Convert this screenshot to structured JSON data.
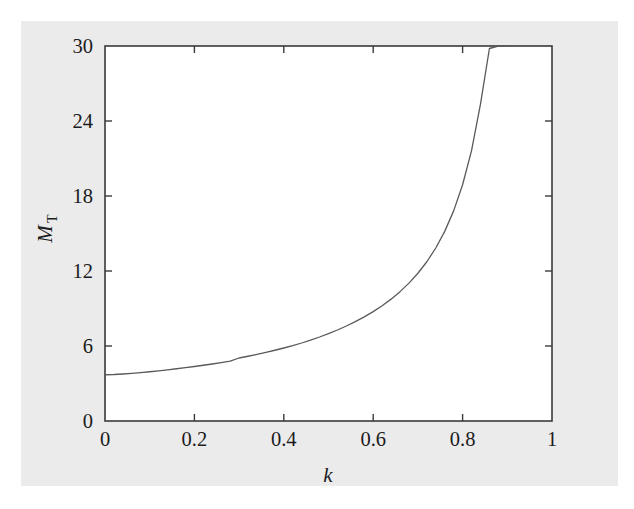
{
  "figure": {
    "background_color": "#ebebeb",
    "plot_background_color": "#ffffff",
    "frame_color": "#3a3a3a",
    "curve_color": "#5a5a5a"
  },
  "chart_data": {
    "type": "line",
    "title": "",
    "subtitle": "",
    "xlabel": "k",
    "ylabel": "M_T",
    "ylabel_base": "M",
    "ylabel_subscript": "T",
    "xlim": [
      0,
      1
    ],
    "ylim": [
      0,
      30
    ],
    "xticks": [
      0,
      0.2,
      0.4,
      0.6,
      0.8,
      1
    ],
    "xtick_labels": [
      "0",
      "0.2",
      "0.4",
      "0.6",
      "0.8",
      "1"
    ],
    "yticks": [
      0,
      6,
      12,
      18,
      24,
      30
    ],
    "ytick_labels": [
      "0",
      "6",
      "12",
      "18",
      "24",
      "30"
    ],
    "grid": false,
    "legend": null,
    "legend_position": "none",
    "annotations": [],
    "series": [
      {
        "name": "M_T(k)",
        "note": "monotonically increasing, diverges as k approaches 1; leaves top of frame at k ~= 0.906",
        "x": [
          0.0,
          0.02,
          0.04,
          0.06,
          0.08,
          0.1,
          0.12,
          0.14,
          0.16,
          0.18,
          0.2,
          0.22,
          0.24,
          0.26,
          0.28,
          0.3,
          0.32,
          0.34,
          0.36,
          0.38,
          0.4,
          0.42,
          0.44,
          0.46,
          0.48,
          0.5,
          0.52,
          0.54,
          0.56,
          0.58,
          0.6,
          0.62,
          0.64,
          0.66,
          0.68,
          0.7,
          0.72,
          0.74,
          0.76,
          0.78,
          0.8,
          0.82,
          0.84,
          0.86,
          0.88,
          0.9,
          0.906
        ],
        "y": [
          3.7,
          3.72,
          3.76,
          3.81,
          3.87,
          3.94,
          4.01,
          4.09,
          4.18,
          4.27,
          4.36,
          4.46,
          4.56,
          4.67,
          4.79,
          5.04,
          5.18,
          5.33,
          5.49,
          5.66,
          5.84,
          6.03,
          6.24,
          6.47,
          6.72,
          6.99,
          7.28,
          7.6,
          7.95,
          8.33,
          8.75,
          9.22,
          9.75,
          10.35,
          11.03,
          11.82,
          12.74,
          13.84,
          15.17,
          16.81,
          18.9,
          21.63,
          25.35,
          29.8,
          30.0,
          30.0,
          30.0
        ]
      }
    ]
  },
  "axes": {
    "tick_direction": "in",
    "ticks_all_sides": true
  }
}
